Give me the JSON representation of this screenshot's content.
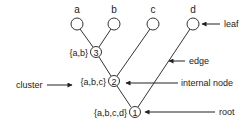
{
  "diagram": {
    "type": "rooted-tree",
    "colors": {
      "stroke": "#333333",
      "text": "#222222",
      "background": "#ffffff"
    },
    "leaves": [
      {
        "id": "a",
        "label": "a"
      },
      {
        "id": "b",
        "label": "b"
      },
      {
        "id": "c",
        "label": "c"
      },
      {
        "id": "d",
        "label": "d"
      }
    ],
    "internal_nodes": [
      {
        "id": "3",
        "label": "3",
        "cluster": "{a,b}"
      },
      {
        "id": "2",
        "label": "2",
        "cluster": "{a,b,c}"
      },
      {
        "id": "1",
        "label": "1",
        "cluster": "{a,b,c,d}"
      }
    ],
    "edges": [
      [
        "a",
        "3"
      ],
      [
        "b",
        "3"
      ],
      [
        "3",
        "2"
      ],
      [
        "c",
        "2"
      ],
      [
        "2",
        "1"
      ],
      [
        "d",
        "1"
      ]
    ],
    "annotations": {
      "leaf": "leaf",
      "edge": "edge",
      "internal_node": "internal node",
      "root": "root",
      "cluster": "cluster"
    }
  }
}
